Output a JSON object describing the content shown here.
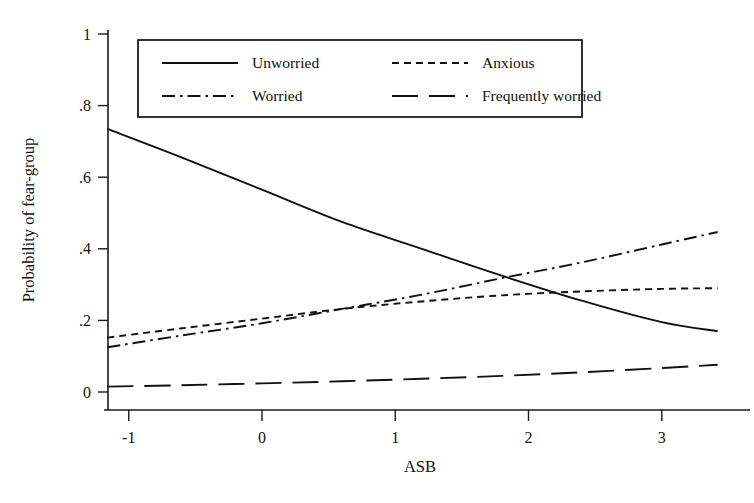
{
  "chart_data": {
    "type": "line",
    "title": "",
    "xlabel": "ASB",
    "ylabel": "Probability of fear-group",
    "xlim": [
      -1.35,
      3.45
    ],
    "ylim": [
      0,
      1
    ],
    "xticks": [
      -1,
      0,
      1,
      2,
      3
    ],
    "xticklabels": [
      "-1",
      "0",
      "1",
      "2",
      "3"
    ],
    "yticks": [
      0,
      0.2,
      0.4,
      0.6,
      0.8,
      1
    ],
    "yticklabels": [
      "0",
      ".2",
      ".4",
      ".6",
      ".8",
      "1"
    ],
    "grid": false,
    "legend_position": "top-center",
    "x": [
      -1.16,
      -0.6,
      0.0,
      0.6,
      1.2,
      1.8,
      2.4,
      3.0,
      3.42
    ],
    "series": [
      {
        "name": "Unworried",
        "style": "solid",
        "values": [
          0.735,
          0.655,
          0.565,
          0.475,
          0.4,
          0.325,
          0.255,
          0.195,
          0.17
        ]
      },
      {
        "name": "Anxious",
        "style": "dotted",
        "values": [
          0.152,
          0.178,
          0.205,
          0.232,
          0.253,
          0.27,
          0.281,
          0.288,
          0.29
        ]
      },
      {
        "name": "Worried",
        "style": "dash-dot",
        "values": [
          0.125,
          0.158,
          0.192,
          0.232,
          0.272,
          0.318,
          0.362,
          0.412,
          0.447
        ]
      },
      {
        "name": "Frequently worried",
        "style": "long-dash",
        "values": [
          0.015,
          0.019,
          0.024,
          0.03,
          0.037,
          0.045,
          0.055,
          0.067,
          0.076
        ]
      }
    ]
  },
  "legend": {
    "entries": [
      {
        "label": "Unworried",
        "style": "solid"
      },
      {
        "label": "Anxious",
        "style": "dotted"
      },
      {
        "label": "Worried",
        "style": "dash-dot"
      },
      {
        "label": "Frequently worried",
        "style": "long-dash"
      }
    ]
  },
  "axes": {
    "x_title": "ASB",
    "y_title": "Probability of fear-group"
  }
}
